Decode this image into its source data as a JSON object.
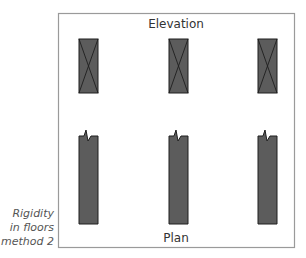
{
  "diagram": {
    "top_label": "Elevation",
    "bottom_label": "Plan",
    "side_caption": [
      "Rigidity",
      "in floors",
      "method 2"
    ],
    "colors": {
      "frame": "#9a9a9a",
      "bar_fill": "#5c5c5c",
      "bar_stroke": "#1e1e1e",
      "text": "#333333",
      "caption": "#555555"
    },
    "elevation_bars": [
      {
        "id": "left",
        "symbol": "cross-braced"
      },
      {
        "id": "middle",
        "symbol": "cross-braced"
      },
      {
        "id": "right",
        "symbol": "cross-braced"
      }
    ],
    "plan_bars": [
      {
        "id": "left",
        "symbol": "break-line"
      },
      {
        "id": "middle",
        "symbol": "break-line"
      },
      {
        "id": "right",
        "symbol": "break-line"
      }
    ]
  }
}
